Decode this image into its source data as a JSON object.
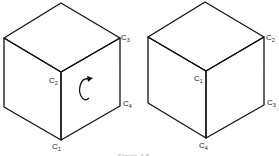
{
  "figure": {
    "caption": "Figure 4.6",
    "left_cube": {
      "labels": [
        {
          "id": "c3",
          "base": "C",
          "sub": "3"
        },
        {
          "id": "c2",
          "base": "C",
          "sub": "2"
        },
        {
          "id": "c4",
          "base": "C",
          "sub": "4"
        },
        {
          "id": "c1",
          "base": "C",
          "sub": "1"
        }
      ],
      "rotation_arrow": "counterclockwise-rotation-arrow"
    },
    "right_cube": {
      "labels": [
        {
          "id": "c2",
          "base": "C",
          "sub": "2"
        },
        {
          "id": "c1",
          "base": "C",
          "sub": "1"
        },
        {
          "id": "c3",
          "base": "C",
          "sub": "3"
        },
        {
          "id": "c4",
          "base": "C",
          "sub": "4"
        }
      ]
    },
    "colors": {
      "stroke": "#111111",
      "background": "#ffffff"
    }
  }
}
